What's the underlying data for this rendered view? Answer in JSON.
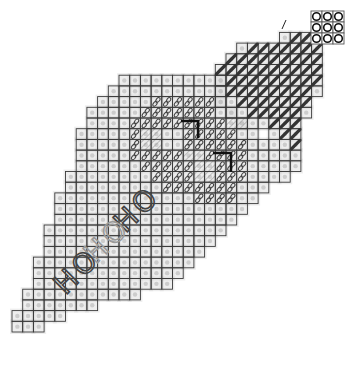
{
  "diagram": {
    "title": "Needlepoint stitch chart",
    "grid": {
      "origin_x": 12,
      "origin_y": 11,
      "cell": 10.7,
      "line_color": "#3a3a3a",
      "halo_color": "#cfcfcf",
      "rows": [
        {
          "r": 6,
          "c0": 10,
          "c1": 19
        },
        {
          "r": 7,
          "c0": 9,
          "c1": 19
        },
        {
          "r": 8,
          "c0": 8,
          "c1": 19
        },
        {
          "r": 9,
          "c0": 7,
          "c1": 20
        },
        {
          "r": 10,
          "c0": 7,
          "c1": 21
        },
        {
          "r": 11,
          "c0": 6,
          "c1": 22
        },
        {
          "r": 12,
          "c0": 6,
          "c1": 24
        },
        {
          "r": 13,
          "c0": 6,
          "c1": 26
        },
        {
          "r": 14,
          "c0": 6,
          "c1": 26
        },
        {
          "r": 15,
          "c0": 5,
          "c1": 25
        },
        {
          "r": 16,
          "c0": 5,
          "c1": 23
        },
        {
          "r": 17,
          "c0": 4,
          "c1": 22
        },
        {
          "r": 18,
          "c0": 4,
          "c1": 21
        },
        {
          "r": 19,
          "c0": 4,
          "c1": 20
        },
        {
          "r": 20,
          "c0": 3,
          "c1": 19
        },
        {
          "r": 21,
          "c0": 3,
          "c1": 18
        },
        {
          "r": 22,
          "c0": 3,
          "c1": 17
        },
        {
          "r": 23,
          "c0": 2,
          "c1": 16
        },
        {
          "r": 24,
          "c0": 2,
          "c1": 15
        },
        {
          "r": 25,
          "c0": 2,
          "c1": 14
        },
        {
          "r": 26,
          "c0": 1,
          "c1": 11
        },
        {
          "r": 27,
          "c0": 1,
          "c1": 7
        },
        {
          "r": 28,
          "c0": 0,
          "c1": 4
        },
        {
          "r": 29,
          "c0": 0,
          "c1": 2
        }
      ],
      "top_rows": [
        {
          "r": 2,
          "c0": 25,
          "c1": 28
        },
        {
          "r": 3,
          "c0": 21,
          "c1": 28
        },
        {
          "r": 4,
          "c0": 20,
          "c1": 28
        },
        {
          "r": 5,
          "c0": 19,
          "c1": 28
        },
        {
          "r": 6,
          "c0": 19,
          "c1": 28
        },
        {
          "r": 7,
          "c0": 19,
          "c1": 28
        },
        {
          "r": 8,
          "c0": 19,
          "c1": 27
        },
        {
          "r": 9,
          "c0": 20,
          "c1": 27
        },
        {
          "r": 10,
          "c0": 21,
          "c1": 26
        },
        {
          "r": 11,
          "c0": 24,
          "c1": 26
        },
        {
          "r": 12,
          "c0": 25,
          "c1": 26
        }
      ]
    },
    "circle_key": {
      "rows": 3,
      "cols": 3,
      "x": 311,
      "y": 11,
      "cell": 11,
      "stroke": "#111111"
    },
    "diagonal_stitches": {
      "color": "#333333",
      "cells": [
        [
          2,
          26
        ],
        [
          2,
          27
        ],
        [
          2,
          28
        ],
        [
          3,
          22
        ],
        [
          3,
          23
        ],
        [
          3,
          24
        ],
        [
          3,
          25
        ],
        [
          3,
          26
        ],
        [
          3,
          27
        ],
        [
          3,
          28
        ],
        [
          4,
          20
        ],
        [
          4,
          21
        ],
        [
          4,
          22
        ],
        [
          4,
          23
        ],
        [
          4,
          24
        ],
        [
          4,
          25
        ],
        [
          4,
          26
        ],
        [
          4,
          27
        ],
        [
          4,
          28
        ],
        [
          5,
          19
        ],
        [
          5,
          20
        ],
        [
          5,
          21
        ],
        [
          5,
          22
        ],
        [
          5,
          23
        ],
        [
          5,
          24
        ],
        [
          5,
          25
        ],
        [
          5,
          26
        ],
        [
          5,
          27
        ],
        [
          5,
          28
        ],
        [
          6,
          20
        ],
        [
          6,
          21
        ],
        [
          6,
          22
        ],
        [
          6,
          23
        ],
        [
          6,
          24
        ],
        [
          6,
          25
        ],
        [
          6,
          26
        ],
        [
          6,
          27
        ],
        [
          6,
          28
        ],
        [
          7,
          20
        ],
        [
          7,
          21
        ],
        [
          7,
          22
        ],
        [
          7,
          23
        ],
        [
          7,
          24
        ],
        [
          7,
          25
        ],
        [
          7,
          26
        ],
        [
          7,
          27
        ],
        [
          8,
          21
        ],
        [
          8,
          22
        ],
        [
          8,
          23
        ],
        [
          8,
          24
        ],
        [
          8,
          25
        ],
        [
          8,
          26
        ],
        [
          8,
          27
        ],
        [
          9,
          22
        ],
        [
          9,
          23
        ],
        [
          9,
          24
        ],
        [
          9,
          25
        ],
        [
          9,
          26
        ],
        [
          10,
          24
        ],
        [
          10,
          25
        ],
        [
          10,
          26
        ],
        [
          11,
          25
        ],
        [
          11,
          26
        ],
        [
          12,
          26
        ]
      ]
    },
    "loop_stitches": {
      "color": "#444444",
      "cells": [
        [
          8,
          13
        ],
        [
          8,
          14
        ],
        [
          8,
          15
        ],
        [
          8,
          16
        ],
        [
          8,
          17
        ],
        [
          8,
          18
        ],
        [
          9,
          12
        ],
        [
          9,
          13
        ],
        [
          9,
          14
        ],
        [
          9,
          15
        ],
        [
          9,
          16
        ],
        [
          9,
          17
        ],
        [
          9,
          18
        ],
        [
          10,
          11
        ],
        [
          10,
          12
        ],
        [
          10,
          13
        ],
        [
          10,
          14
        ],
        [
          10,
          15
        ],
        [
          10,
          16
        ],
        [
          10,
          17
        ],
        [
          10,
          18
        ],
        [
          10,
          19
        ],
        [
          11,
          11
        ],
        [
          11,
          16
        ],
        [
          11,
          17
        ],
        [
          11,
          18
        ],
        [
          11,
          19
        ],
        [
          11,
          20
        ],
        [
          12,
          11
        ],
        [
          12,
          16
        ],
        [
          12,
          17
        ],
        [
          12,
          18
        ],
        [
          12,
          19
        ],
        [
          12,
          20
        ],
        [
          12,
          21
        ],
        [
          13,
          11
        ],
        [
          13,
          12
        ],
        [
          13,
          13
        ],
        [
          13,
          14
        ],
        [
          13,
          15
        ],
        [
          13,
          18
        ],
        [
          13,
          19
        ],
        [
          13,
          20
        ],
        [
          13,
          21
        ],
        [
          14,
          12
        ],
        [
          14,
          13
        ],
        [
          14,
          14
        ],
        [
          14,
          15
        ],
        [
          14,
          16
        ],
        [
          14,
          19
        ],
        [
          14,
          20
        ],
        [
          14,
          21
        ],
        [
          15,
          13
        ],
        [
          15,
          14
        ],
        [
          15,
          15
        ],
        [
          15,
          16
        ],
        [
          15,
          19
        ],
        [
          15,
          20
        ],
        [
          15,
          21
        ],
        [
          16,
          14
        ],
        [
          16,
          15
        ],
        [
          16,
          16
        ],
        [
          16,
          17
        ],
        [
          16,
          18
        ],
        [
          16,
          19
        ],
        [
          16,
          20
        ],
        [
          17,
          17
        ],
        [
          17,
          18
        ],
        [
          17,
          19
        ],
        [
          17,
          20
        ]
      ]
    },
    "hatched_cells": {
      "color": "#8a8a8a",
      "cells": [
        [
          11,
          12
        ],
        [
          11,
          13
        ],
        [
          12,
          12
        ],
        [
          12,
          13
        ],
        [
          14,
          17
        ],
        [
          14,
          18
        ],
        [
          15,
          17
        ],
        [
          15,
          18
        ],
        [
          10,
          20
        ],
        [
          10,
          21
        ],
        [
          13,
          16
        ],
        [
          13,
          17
        ]
      ]
    },
    "corner_marks": {
      "color": "#111111",
      "items": [
        {
          "x1": 181,
          "y1": 121,
          "x2": 198,
          "y2": 121,
          "x3": 198,
          "y3": 138
        },
        {
          "x1": 213,
          "y1": 153,
          "x2": 231,
          "y2": 153,
          "x3": 231,
          "y3": 172
        }
      ]
    },
    "labels": [
      {
        "text": "HO",
        "x": 138,
        "y": 210,
        "rotate": -45,
        "color": "#444444",
        "size": 28
      },
      {
        "text": "HO",
        "x": 108,
        "y": 241,
        "rotate": -45,
        "color": "#9a9a9a",
        "size": 28
      },
      {
        "text": "HO",
        "x": 78,
        "y": 272,
        "rotate": -45,
        "color": "#444444",
        "size": 28
      }
    ],
    "small_tick": {
      "x1": 282,
      "y1": 29,
      "x2": 286,
      "y2": 20,
      "color": "#222222"
    }
  }
}
